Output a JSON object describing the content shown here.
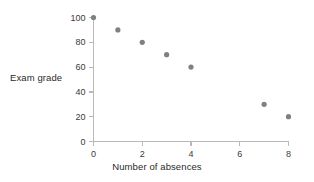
{
  "chart_data": {
    "type": "scatter",
    "title": "",
    "xlabel": "Number of absences",
    "ylabel": "Exam grade",
    "xlim": [
      0,
      8
    ],
    "ylim": [
      0,
      100
    ],
    "xticks": [
      0,
      2,
      4,
      6,
      8
    ],
    "yticks": [
      0,
      20,
      40,
      60,
      80,
      100
    ],
    "xticklabels": [
      "0",
      "2",
      "4",
      "6",
      "8"
    ],
    "yticklabels": [
      "0",
      "20",
      "40",
      "60",
      "80",
      "100"
    ],
    "grid": false,
    "legend": null,
    "series": [
      {
        "name": "Exam grade vs absences",
        "marker": "circle",
        "color": "#808080",
        "points": [
          {
            "x": 0,
            "y": 100
          },
          {
            "x": 1,
            "y": 90
          },
          {
            "x": 2,
            "y": 80
          },
          {
            "x": 3,
            "y": 70
          },
          {
            "x": 4,
            "y": 60
          },
          {
            "x": 7,
            "y": 30
          },
          {
            "x": 8,
            "y": 20
          }
        ]
      }
    ]
  },
  "style": {
    "background": "#ffffff",
    "axis_color": "#b9b9b9",
    "tick_color": "#b9b9b9",
    "marker_color": "#808080",
    "label_color": "#2b2b2b"
  }
}
